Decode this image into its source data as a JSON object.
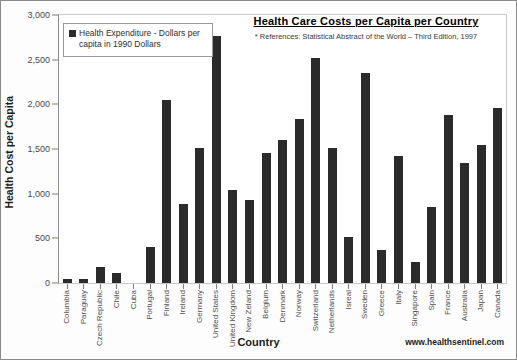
{
  "chart_data": {
    "type": "bar",
    "title": "Health Care Costs per Capita per Country",
    "subtitle": "* References: Statistical Abstract of the World – Third Edition, 1997",
    "xlabel": "Country",
    "ylabel": "Health Cost per Capita",
    "ylim": [
      0,
      3000
    ],
    "ytick_labels": [
      "3,000",
      "2,500",
      "2,000",
      "1,500",
      "1,000",
      "500",
      "0"
    ],
    "ytick_values": [
      3000,
      2500,
      2000,
      1500,
      1000,
      500,
      0
    ],
    "grid": false,
    "legend_position": "top-left",
    "legend": [
      "Health Expenditure - Dollars per capita in 1990 Dollars"
    ],
    "bar_color": "#2b2b2b",
    "categories": [
      "Columbia",
      "Paraguay",
      "Czech Republic",
      "Chile",
      "Cuba",
      "Portugal",
      "Finland",
      "Ireland",
      "Germany",
      "United States",
      "United Kingdom",
      "New Zeland",
      "Belgium",
      "Denmark",
      "Norway",
      "Switzerland",
      "Netherlands",
      "Isreal",
      "Sweden",
      "Greece",
      "Italy",
      "Singapore",
      "Spain",
      "France",
      "Australia",
      "Japan",
      "Canada"
    ],
    "values": [
      50,
      40,
      180,
      110,
      0,
      400,
      2050,
      880,
      1510,
      2770,
      1040,
      930,
      1450,
      1600,
      1840,
      2520,
      1510,
      510,
      2350,
      370,
      1420,
      230,
      850,
      1880,
      1340,
      1550,
      1960
    ]
  },
  "footer": {
    "url": "www.healthsentinel.com"
  }
}
